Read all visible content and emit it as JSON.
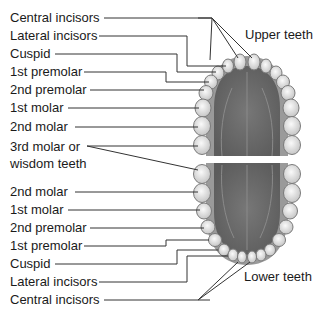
{
  "upper": {
    "title": "Upper teeth",
    "labels": [
      "Central incisors",
      "Lateral incisors",
      "Cuspid",
      "1st premolar",
      "2nd premolar",
      "1st molar",
      "2nd molar"
    ]
  },
  "wisdom": {
    "line1": "3rd molar or",
    "line2": "wisdom teeth"
  },
  "lower": {
    "title": "Lower teeth",
    "labels": [
      "2nd molar",
      "1st molar",
      "2nd premolar",
      "1st premolar",
      "Cuspid",
      "Lateral incisors",
      "Central incisors"
    ]
  },
  "colors": {
    "gum": "#6b6b6b",
    "tooth": "#e6e6e6",
    "tooth_outline": "#8a8a8a",
    "leader": "#333333",
    "divider": "#ffffff"
  }
}
